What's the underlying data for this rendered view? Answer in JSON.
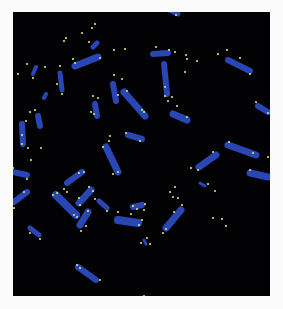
{
  "image": {
    "description": "Metaphase chromosome spread, DAPI-stained chromosomes (blue) with telomere FISH signals (yellow-green)",
    "background": "#020204",
    "chromosome_color": "#2b4ec4",
    "signal_color": "#cfe866"
  },
  "chromosomes": [
    {
      "x1": 165,
      "y1": 8,
      "x2": 178,
      "y2": 14,
      "w": 5
    },
    {
      "x1": 75,
      "y1": 66,
      "x2": 98,
      "y2": 57,
      "w": 7
    },
    {
      "x1": 93,
      "y1": 47,
      "x2": 97,
      "y2": 43,
      "w": 5
    },
    {
      "x1": 153,
      "y1": 54,
      "x2": 168,
      "y2": 53,
      "w": 6
    },
    {
      "x1": 164,
      "y1": 64,
      "x2": 167,
      "y2": 94,
      "w": 6
    },
    {
      "x1": 228,
      "y1": 60,
      "x2": 250,
      "y2": 71,
      "w": 6
    },
    {
      "x1": 60,
      "y1": 73,
      "x2": 62,
      "y2": 90,
      "w": 5
    },
    {
      "x1": 33,
      "y1": 74,
      "x2": 36,
      "y2": 67,
      "w": 4
    },
    {
      "x1": 113,
      "y1": 84,
      "x2": 116,
      "y2": 101,
      "w": 6
    },
    {
      "x1": 124,
      "y1": 92,
      "x2": 145,
      "y2": 116,
      "w": 7
    },
    {
      "x1": 46,
      "y1": 94,
      "x2": 44,
      "y2": 98,
      "w": 4
    },
    {
      "x1": 95,
      "y1": 104,
      "x2": 97,
      "y2": 116,
      "w": 6
    },
    {
      "x1": 38,
      "y1": 116,
      "x2": 40,
      "y2": 126,
      "w": 6
    },
    {
      "x1": 258,
      "y1": 106,
      "x2": 268,
      "y2": 112,
      "w": 6
    },
    {
      "x1": 173,
      "y1": 114,
      "x2": 187,
      "y2": 120,
      "w": 7
    },
    {
      "x1": 22,
      "y1": 124,
      "x2": 23,
      "y2": 144,
      "w": 6
    },
    {
      "x1": 128,
      "y1": 135,
      "x2": 142,
      "y2": 139,
      "w": 6
    },
    {
      "x1": 106,
      "y1": 147,
      "x2": 118,
      "y2": 172,
      "w": 7
    },
    {
      "x1": 228,
      "y1": 145,
      "x2": 256,
      "y2": 155,
      "w": 7
    },
    {
      "x1": 199,
      "y1": 167,
      "x2": 216,
      "y2": 155,
      "w": 7
    },
    {
      "x1": 13,
      "y1": 172,
      "x2": 27,
      "y2": 175,
      "w": 6
    },
    {
      "x1": 67,
      "y1": 183,
      "x2": 82,
      "y2": 172,
      "w": 6
    },
    {
      "x1": 250,
      "y1": 173,
      "x2": 268,
      "y2": 177,
      "w": 7
    },
    {
      "x1": 14,
      "y1": 202,
      "x2": 27,
      "y2": 192,
      "w": 6
    },
    {
      "x1": 56,
      "y1": 195,
      "x2": 76,
      "y2": 215,
      "w": 8
    },
    {
      "x1": 79,
      "y1": 203,
      "x2": 91,
      "y2": 190,
      "w": 7
    },
    {
      "x1": 99,
      "y1": 201,
      "x2": 107,
      "y2": 208,
      "w": 5
    },
    {
      "x1": 133,
      "y1": 207,
      "x2": 142,
      "y2": 205,
      "w": 6
    },
    {
      "x1": 166,
      "y1": 228,
      "x2": 181,
      "y2": 210,
      "w": 7
    },
    {
      "x1": 118,
      "y1": 220,
      "x2": 138,
      "y2": 223,
      "w": 8
    },
    {
      "x1": 80,
      "y1": 225,
      "x2": 88,
      "y2": 212,
      "w": 7
    },
    {
      "x1": 30,
      "y1": 228,
      "x2": 39,
      "y2": 235,
      "w": 5
    },
    {
      "x1": 78,
      "y1": 267,
      "x2": 96,
      "y2": 280,
      "w": 6
    },
    {
      "x1": 144,
      "y1": 240,
      "x2": 146,
      "y2": 244,
      "w": 3
    },
    {
      "x1": 200,
      "y1": 183,
      "x2": 205,
      "y2": 186,
      "w": 3
    }
  ],
  "signals": [
    [
      162,
      3
    ],
    [
      170,
      6
    ],
    [
      176,
      15
    ],
    [
      82,
      33
    ],
    [
      92,
      28
    ],
    [
      95,
      24
    ],
    [
      64,
      41
    ],
    [
      66,
      38
    ],
    [
      89,
      42
    ],
    [
      114,
      50
    ],
    [
      125,
      49
    ],
    [
      156,
      47
    ],
    [
      169,
      50
    ],
    [
      175,
      52
    ],
    [
      186,
      55
    ],
    [
      185,
      72
    ],
    [
      197,
      61
    ],
    [
      187,
      59
    ],
    [
      218,
      54
    ],
    [
      227,
      50
    ],
    [
      240,
      58
    ],
    [
      250,
      74
    ],
    [
      27,
      64
    ],
    [
      18,
      74
    ],
    [
      33,
      78
    ],
    [
      45,
      67
    ],
    [
      60,
      66
    ],
    [
      57,
      84
    ],
    [
      62,
      94
    ],
    [
      73,
      59
    ],
    [
      75,
      63
    ],
    [
      100,
      58
    ],
    [
      114,
      75
    ],
    [
      122,
      79
    ],
    [
      118,
      95
    ],
    [
      127,
      91
    ],
    [
      142,
      110
    ],
    [
      144,
      112
    ],
    [
      93,
      96
    ],
    [
      98,
      98
    ],
    [
      94,
      114
    ],
    [
      91,
      112
    ],
    [
      165,
      87
    ],
    [
      172,
      97
    ],
    [
      165,
      96
    ],
    [
      168,
      101
    ],
    [
      177,
      106
    ],
    [
      187,
      117
    ],
    [
      256,
      102
    ],
    [
      268,
      113
    ],
    [
      30,
      112
    ],
    [
      35,
      110
    ],
    [
      26,
      121
    ],
    [
      22,
      135
    ],
    [
      22,
      144
    ],
    [
      28,
      148
    ],
    [
      31,
      160
    ],
    [
      41,
      148
    ],
    [
      110,
      136
    ],
    [
      126,
      133
    ],
    [
      140,
      141
    ],
    [
      103,
      147
    ],
    [
      109,
      141
    ],
    [
      113,
      174
    ],
    [
      118,
      172
    ],
    [
      229,
      142
    ],
    [
      253,
      153
    ],
    [
      268,
      157
    ],
    [
      213,
      152
    ],
    [
      198,
      170
    ],
    [
      191,
      168
    ],
    [
      13,
      168
    ],
    [
      27,
      179
    ],
    [
      79,
      173
    ],
    [
      84,
      172
    ],
    [
      64,
      189
    ],
    [
      67,
      192
    ],
    [
      250,
      170
    ],
    [
      14,
      208
    ],
    [
      24,
      192
    ],
    [
      53,
      195
    ],
    [
      57,
      193
    ],
    [
      74,
      215
    ],
    [
      77,
      217
    ],
    [
      80,
      205
    ],
    [
      79,
      198
    ],
    [
      89,
      187
    ],
    [
      93,
      191
    ],
    [
      95,
      199
    ],
    [
      107,
      211
    ],
    [
      133,
      206
    ],
    [
      137,
      209
    ],
    [
      144,
      210
    ],
    [
      145,
      204
    ],
    [
      118,
      212
    ],
    [
      139,
      225
    ],
    [
      131,
      214
    ],
    [
      142,
      220
    ],
    [
      166,
      229
    ],
    [
      174,
      212
    ],
    [
      182,
      205
    ],
    [
      170,
      192
    ],
    [
      175,
      187
    ],
    [
      173,
      197
    ],
    [
      178,
      198
    ],
    [
      163,
      233
    ],
    [
      81,
      231
    ],
    [
      86,
      226
    ],
    [
      88,
      211
    ],
    [
      30,
      233
    ],
    [
      40,
      239
    ],
    [
      147,
      238
    ],
    [
      150,
      244
    ],
    [
      141,
      243
    ],
    [
      213,
      218
    ],
    [
      226,
      226
    ],
    [
      222,
      219
    ],
    [
      77,
      265
    ],
    [
      80,
      268
    ],
    [
      100,
      280
    ],
    [
      144,
      296
    ],
    [
      215,
      191
    ],
    [
      208,
      184
    ]
  ]
}
